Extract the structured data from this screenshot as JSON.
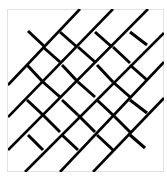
{
  "figure": {
    "frame": {
      "x": 7,
      "y": 9,
      "width": 157,
      "height": 163,
      "border_color": "#e2e2e2"
    },
    "stroke_color": "#000000",
    "long_line_width": 2.6,
    "short_line_width": 3.0,
    "long_lines": [
      [
        8,
        85,
        80,
        9
      ],
      [
        8,
        117,
        113,
        9
      ],
      [
        8,
        150,
        148,
        9
      ],
      [
        25,
        172,
        164,
        33
      ],
      [
        60,
        172,
        164,
        62
      ],
      [
        93,
        172,
        164,
        98
      ]
    ],
    "short_segments": [
      [
        28,
        31,
        45,
        47
      ],
      [
        60,
        32,
        77,
        47
      ],
      [
        95,
        32,
        112,
        47
      ],
      [
        130,
        32,
        147,
        45
      ],
      [
        43,
        47,
        60,
        62
      ],
      [
        78,
        47,
        95,
        62
      ],
      [
        113,
        47,
        130,
        63
      ],
      [
        27,
        65,
        43,
        82
      ],
      [
        62,
        65,
        78,
        82
      ],
      [
        97,
        65,
        113,
        82
      ],
      [
        130,
        65,
        147,
        80
      ],
      [
        43,
        82,
        60,
        97
      ],
      [
        78,
        82,
        95,
        97
      ],
      [
        113,
        82,
        130,
        97
      ],
      [
        27,
        100,
        43,
        115
      ],
      [
        62,
        100,
        78,
        115
      ],
      [
        97,
        100,
        113,
        115
      ],
      [
        130,
        100,
        147,
        113
      ],
      [
        43,
        115,
        60,
        132
      ],
      [
        78,
        115,
        95,
        132
      ],
      [
        113,
        115,
        130,
        132
      ],
      [
        28,
        135,
        43,
        150
      ],
      [
        62,
        135,
        78,
        150
      ],
      [
        97,
        135,
        113,
        150
      ],
      [
        130,
        135,
        145,
        148
      ]
    ]
  }
}
